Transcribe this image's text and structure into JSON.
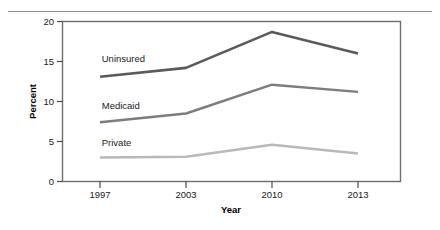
{
  "chart_data": {
    "type": "line",
    "title": "",
    "xlabel": "Year",
    "ylabel": "Percent",
    "x": [
      1997,
      2003,
      2010,
      2013
    ],
    "categories": [
      "1997",
      "2003",
      "2010",
      "2013"
    ],
    "xtick_labels": [
      "1997",
      "2003",
      "2010",
      "2013"
    ],
    "ytick_labels": [
      "0",
      "5",
      "10",
      "15",
      "20"
    ],
    "yticks": [
      0,
      5,
      10,
      15,
      20
    ],
    "ylim": [
      0,
      20
    ],
    "xlim": [
      1995.3,
      2015.1
    ],
    "grid": false,
    "legend_position": "inline-labels",
    "series": [
      {
        "name": "Uninsured",
        "label": "Uninsured",
        "color": "#5a5a5a",
        "line_width": 2.6,
        "values": [
          13.1,
          14.2,
          18.7,
          16.0
        ],
        "label_x": 1997.6,
        "label_y": 14.9
      },
      {
        "name": "Medicaid",
        "label": "Medicaid",
        "color": "#7d7d7d",
        "line_width": 2.4,
        "values": [
          7.4,
          8.5,
          12.1,
          11.2
        ],
        "label_x": 1997.6,
        "label_y": 9.1
      },
      {
        "name": "Private",
        "label": "Private",
        "color": "#b9b9b9",
        "line_width": 2.4,
        "values": [
          3.0,
          3.1,
          4.6,
          3.5
        ],
        "label_x": 1997.6,
        "label_y": 4.4
      }
    ],
    "annotations": [
      {
        "text": "Uninsured",
        "kind": "series-inline-label"
      },
      {
        "text": "Medicaid",
        "kind": "series-inline-label"
      },
      {
        "text": "Private",
        "kind": "series-inline-label"
      }
    ]
  },
  "axes": {
    "x_title": "Year",
    "y_title": "Percent",
    "x_tick_labels": [
      "1997",
      "2003",
      "2010",
      "2013"
    ],
    "y_tick_labels": [
      "20",
      "15",
      "10",
      "5",
      "0"
    ]
  },
  "colors": {
    "frame": "#6e6e6e",
    "rule": "#8b8b8b",
    "text": "#1a1a1a",
    "series_uninsured": "#5a5a5a",
    "series_medicaid": "#7d7d7d",
    "series_private": "#b9b9b9",
    "background": "#ffffff"
  }
}
